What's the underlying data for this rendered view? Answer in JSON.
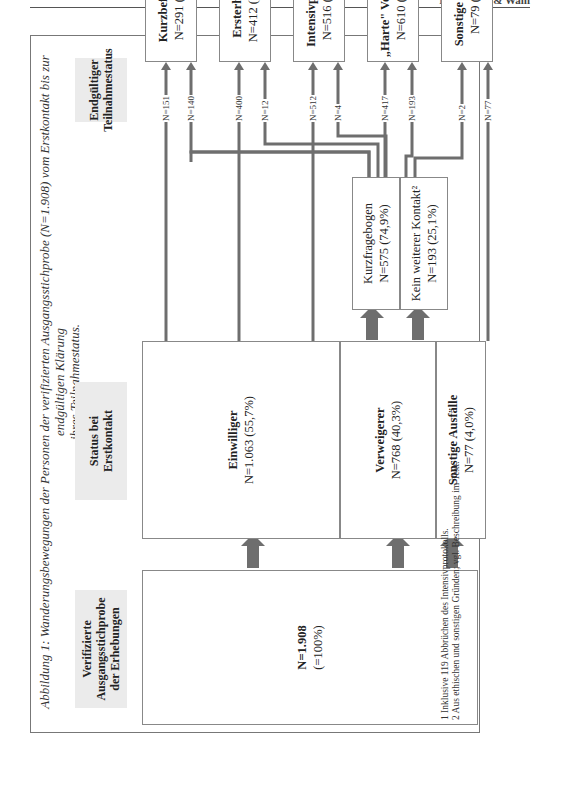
{
  "page": {
    "running_head": "Nachmann & Wahl"
  },
  "figure": {
    "caption_line1": "Abbildung 1: Wanderungsbewegungen der Personen der verifizierten Ausgangsstichprobe (N=1.908) vom Erstkontakt bis zur endgültigen Klärung",
    "caption_line2": "ihres Teilnahmestatus.",
    "column_headers": {
      "sample": [
        "Verifizierte",
        "Ausgangsstichprobe",
        "der Erhebungen"
      ],
      "first_contact": [
        "Status bei",
        "Erstkontakt"
      ],
      "final": [
        "Endgültiger",
        "Teilnahmestatus"
      ]
    },
    "sample_box": {
      "n": "N=1.908",
      "pct": "(=100%)"
    },
    "first_contact_boxes": [
      {
        "label": "Einwilliger",
        "value": "N=1.063 (55,7%)"
      },
      {
        "label": "Verweigerer",
        "value": "N=768 (40,3%)"
      },
      {
        "label": "Sonstige Ausfälle",
        "value": "N=77 (4,0%)"
      }
    ],
    "intermediate_boxes": [
      {
        "label": "Kurzfragebogen",
        "value": "N=575 (74,9%)"
      },
      {
        "label": "Kein weiterer Kontakt²",
        "value": "N=193 (25,1%)"
      }
    ],
    "final_boxes": [
      {
        "label": "Kurzbefragung",
        "value": "N=291 (15,3%)"
      },
      {
        "label": "Ersterhebung",
        "value": "N=412 (21,6%)¹"
      },
      {
        "label": "Intensivprotokoll",
        "value": "N=516 (27,0%)"
      },
      {
        "label": "„Harte\" Verweigerer",
        "value": "N=610 (32,0%)"
      },
      {
        "label": "Sonstige Ausfälle",
        "value": "N=79 (4,1%)"
      }
    ],
    "flows": [
      {
        "from": "Einwilliger",
        "to": "Kurzbefragung",
        "label": "N=151"
      },
      {
        "from": "Kurzfragebogen",
        "to": "Kurzbefragung",
        "label": "N=140"
      },
      {
        "from": "Einwilliger",
        "to": "Ersterhebung",
        "label": "N=400"
      },
      {
        "from": "Kurzfragebogen",
        "to": "Ersterhebung",
        "label": "N=12"
      },
      {
        "from": "Einwilliger",
        "to": "Intensivprotokoll",
        "label": "N=512"
      },
      {
        "from": "Kurzfragebogen",
        "to": "Intensivprotokoll",
        "label": "N=4"
      },
      {
        "from": "Kurzfragebogen",
        "to": "„Harte\" Verweigerer",
        "label": "N=417"
      },
      {
        "from": "Kein weiterer Kontakt",
        "to": "„Harte\" Verweigerer",
        "label": "N=193"
      },
      {
        "from": "Kurzfragebogen",
        "to": "Sonstige Ausfälle",
        "label": "N=2"
      },
      {
        "from": "Sonstige Ausfälle",
        "to": "Sonstige Ausfälle",
        "label": "N=77"
      }
    ],
    "footnotes": [
      "1  Inklusive 119 Abbrüchen des Intensivprotokolls.",
      "2  Aus ethischen und sonstigen Gründen; vgl. Beschreibung im Text."
    ],
    "colors": {
      "line": "#6e6e6e",
      "header_bg": "#ebebeb",
      "border": "#888888"
    }
  }
}
